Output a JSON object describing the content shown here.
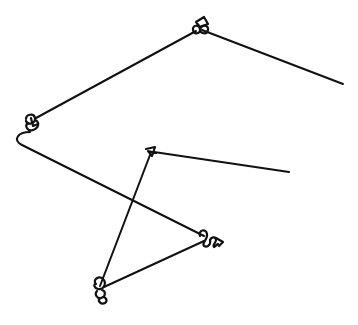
{
  "caption": "",
  "drawing": {
    "stroke_color": "#111111",
    "background": "#ffffff",
    "stroke_width": 2,
    "segments": [
      {
        "name": "segment-top-to-right-end",
        "from": [
          200,
          30
        ],
        "to": [
          343,
          84
        ]
      },
      {
        "name": "segment-top-to-upper-left",
        "from": [
          198,
          30
        ],
        "to": [
          32,
          120
        ]
      },
      {
        "name": "segment-left-hook-to-right-knot",
        "from": [
          20,
          138
        ],
        "to": [
          206,
          237
        ]
      },
      {
        "name": "segment-right-knot-to-bottom",
        "from": [
          205,
          240
        ],
        "to": [
          102,
          288
        ]
      },
      {
        "name": "segment-bottom-to-middle",
        "from": [
          100,
          288
        ],
        "to": [
          150,
          153
        ]
      },
      {
        "name": "segment-middle-to-right-end",
        "from": [
          152,
          152
        ],
        "to": [
          289,
          172
        ]
      }
    ],
    "knots": [
      {
        "name": "knot-top",
        "center": [
          200,
          27
        ]
      },
      {
        "name": "knot-upper-left",
        "center": [
          33,
          123
        ]
      },
      {
        "name": "knot-middle",
        "center": [
          151,
          152
        ]
      },
      {
        "name": "knot-right",
        "center": [
          212,
          240
        ]
      },
      {
        "name": "knot-bottom",
        "center": [
          101,
          291
        ]
      }
    ]
  }
}
